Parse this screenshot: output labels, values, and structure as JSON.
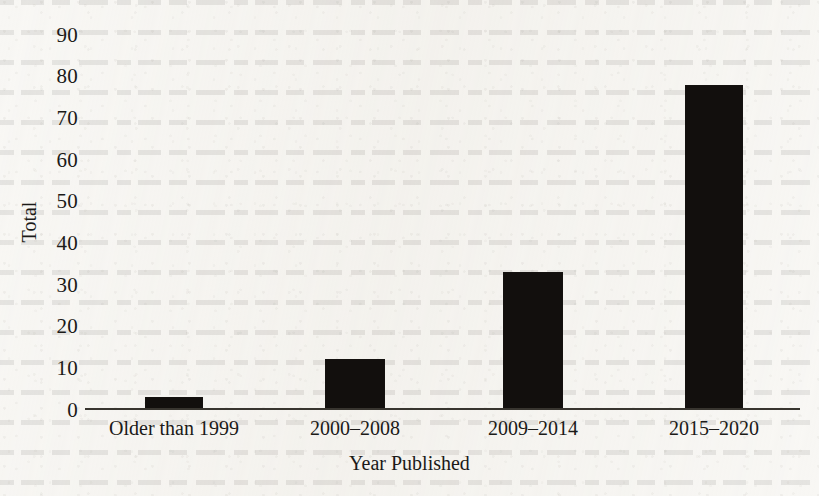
{
  "chart_data": {
    "type": "bar",
    "title": "",
    "xlabel": "Year Published",
    "ylabel": "Total",
    "categories": [
      "Older than 1999",
      "2000–2008",
      "2009–2014",
      "2015–2020"
    ],
    "values": [
      3,
      12,
      33,
      78
    ],
    "series": [
      {
        "name": "Total",
        "values": [
          3,
          12,
          33,
          78
        ]
      }
    ],
    "ylim": [
      0,
      90
    ],
    "yticks": [
      0,
      10,
      20,
      30,
      40,
      50,
      60,
      70,
      80,
      90
    ],
    "ytick_labels": [
      "0",
      "10",
      "20",
      "30",
      "40",
      "50",
      "60",
      "70",
      "80",
      "90"
    ],
    "grid": false,
    "legend": false,
    "legend_position": "none",
    "bar_color": "#120f0d",
    "axis_color": "#38352f",
    "background_color": "#f8f7f4",
    "text_color": "#1b1a18"
  },
  "axes": {
    "y_title": "Total",
    "x_title": "Year Published"
  }
}
